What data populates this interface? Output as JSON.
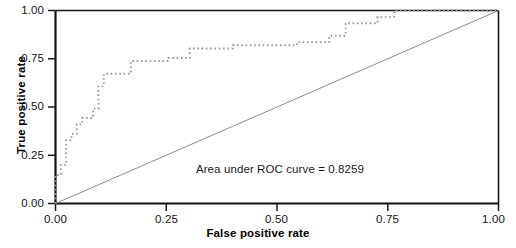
{
  "chart_data": {
    "type": "line",
    "title": "",
    "xlabel": "False positive rate",
    "ylabel": "True positive rate",
    "xlim": [
      0.0,
      1.0
    ],
    "ylim": [
      0.0,
      1.0
    ],
    "grid": false,
    "legend": "none",
    "xticks": [
      "0.00",
      "0.25",
      "0.50",
      "0.75",
      "1.00"
    ],
    "xtick_values": [
      0.0,
      0.25,
      0.5,
      0.75,
      1.0
    ],
    "yticks": [
      "0.00",
      "0.25",
      "0.50",
      "0.75",
      "1.00"
    ],
    "ytick_values": [
      0.0,
      0.25,
      0.5,
      0.75,
      1.0
    ],
    "annotations": [
      {
        "name": "auc-label",
        "text": "Area under ROC curve = 0.8259",
        "x": 0.51,
        "y": 0.175
      }
    ],
    "series": [
      {
        "name": "ROC curve",
        "style": "dotted-step",
        "color": "#9a9a9a",
        "x": [
          0.0,
          0.0,
          0.012,
          0.012,
          0.024,
          0.024,
          0.024,
          0.036,
          0.036,
          0.048,
          0.048,
          0.06,
          0.06,
          0.085,
          0.085,
          0.097,
          0.097,
          0.109,
          0.109,
          0.17,
          0.17,
          0.255,
          0.255,
          0.303,
          0.303,
          0.364,
          0.364,
          0.4,
          0.4,
          0.46,
          0.46,
          0.545,
          0.545,
          0.618,
          0.618,
          0.655,
          0.655,
          0.727,
          0.727,
          0.764,
          0.764,
          1.0
        ],
        "y": [
          0.0,
          0.148,
          0.148,
          0.2,
          0.2,
          0.262,
          0.328,
          0.328,
          0.361,
          0.361,
          0.41,
          0.41,
          0.443,
          0.443,
          0.492,
          0.492,
          0.607,
          0.607,
          0.672,
          0.672,
          0.738,
          0.738,
          0.754,
          0.754,
          0.803,
          0.803,
          0.803,
          0.803,
          0.82,
          0.82,
          0.82,
          0.82,
          0.836,
          0.836,
          0.869,
          0.869,
          0.934,
          0.934,
          0.967,
          0.967,
          1.0,
          1.0
        ]
      },
      {
        "name": "Reference diagonal",
        "style": "solid-thin",
        "color": "#8d8d8d",
        "x": [
          0.0,
          1.0
        ],
        "y": [
          0.0,
          1.0
        ]
      }
    ]
  },
  "axes": {
    "frame_color": "#1a1a1a",
    "tick_color": "#1a1a1a"
  }
}
